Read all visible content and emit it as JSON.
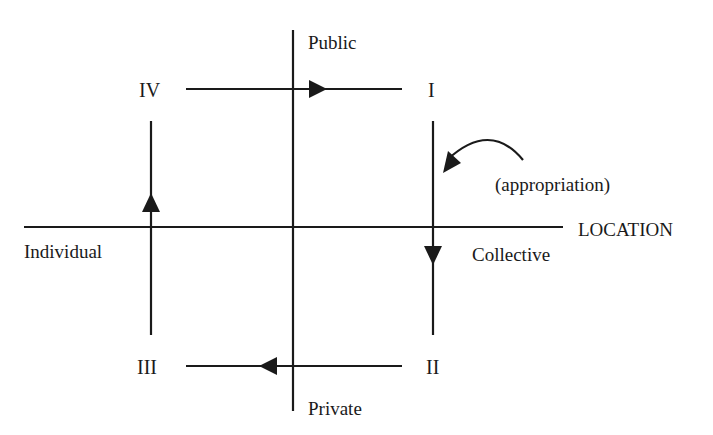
{
  "diagram": {
    "type": "quadrant-cycle",
    "axes": {
      "horizontal": {
        "label": "LOCATION",
        "left_pole": "Individual",
        "right_pole": "Collective"
      },
      "vertical": {
        "top_pole": "Public",
        "bottom_pole": "Private",
        "top_label_clipped": true
      }
    },
    "quadrants": {
      "q1": "I",
      "q2": "II",
      "q3": "III",
      "q4": "IV"
    },
    "flows": [
      {
        "from": "IV",
        "to": "I",
        "direction": "right"
      },
      {
        "from": "I",
        "to": "II",
        "direction": "down",
        "annotation": "(appropriation)"
      },
      {
        "from": "II",
        "to": "III",
        "direction": "left"
      },
      {
        "from": "III",
        "to": "IV",
        "direction": "up"
      }
    ],
    "line_color": "#1a1a1a"
  }
}
